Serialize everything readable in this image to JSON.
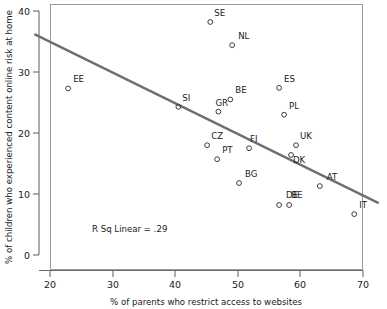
{
  "chart_data": {
    "type": "scatter",
    "title": "",
    "xlabel": "% of parents who restrict access to websites",
    "ylabel": "% of children who experienced content online risk at home",
    "xlim": [
      17,
      73
    ],
    "ylim": [
      -2,
      42
    ],
    "xticks": [
      20,
      30,
      40,
      50,
      60,
      70
    ],
    "yticks": [
      0,
      10,
      20,
      30,
      40
    ],
    "grid": false,
    "legend": null,
    "annotation": "R Sq Linear = .29",
    "marker_style": "open-circle",
    "fit_line": {
      "type": "linear",
      "r_squared": 0.29,
      "x_start": 17.5,
      "y_start": 36.2,
      "x_end": 72.5,
      "y_end": 8.5,
      "color": "#6f6f6f"
    },
    "points": [
      {
        "label": "EE",
        "x": 22.9,
        "y": 27.3
      },
      {
        "label": "SE",
        "x": 45.6,
        "y": 38.2
      },
      {
        "label": "NL",
        "x": 49.1,
        "y": 34.4
      },
      {
        "label": "SI",
        "x": 40.5,
        "y": 24.3
      },
      {
        "label": "BE",
        "x": 48.8,
        "y": 25.5
      },
      {
        "label": "GR",
        "x": 46.9,
        "y": 23.5
      },
      {
        "label": "ES",
        "x": 56.6,
        "y": 27.4
      },
      {
        "label": "PL",
        "x": 57.4,
        "y": 23.0
      },
      {
        "label": "CZ",
        "x": 45.1,
        "y": 18.0
      },
      {
        "label": "PT",
        "x": 46.7,
        "y": 15.7
      },
      {
        "label": "FI",
        "x": 51.8,
        "y": 17.5
      },
      {
        "label": "UK",
        "x": 59.3,
        "y": 18.0
      },
      {
        "label": "DK",
        "x": 58.5,
        "y": 16.4
      },
      {
        "label": "BG",
        "x": 50.2,
        "y": 11.8
      },
      {
        "label": "AT",
        "x": 63.1,
        "y": 11.3
      },
      {
        "label": "DE",
        "x": 56.6,
        "y": 8.2
      },
      {
        "label": "BE2",
        "x": 58.2,
        "y": 8.2
      },
      {
        "label": "IT",
        "x": 68.6,
        "y": 6.7
      }
    ],
    "point_labels": {
      "EE": "EE",
      "SE": "SE",
      "NL": "NL",
      "SI": "SI",
      "BE": "BE",
      "GR": "GR",
      "ES": "ES",
      "PL": "PL",
      "CZ": "CZ",
      "PT": "PT",
      "FI": "FI",
      "UK": "UK",
      "DK": "DK",
      "BG": "BG",
      "AT": "AT",
      "DE": "DE",
      "BE2": "BE",
      "IT": "IT"
    }
  },
  "axes": {
    "x_tick_labels": [
      "20",
      "30",
      "40",
      "50",
      "60",
      "70"
    ],
    "y_tick_labels": [
      "0",
      "10",
      "20",
      "30",
      "40"
    ],
    "x_axis_title": "% of parents who restrict access to websites",
    "y_axis_title": "% of children who experienced content online risk at home"
  },
  "annotation": {
    "r_squared_text": "R Sq Linear = .29"
  }
}
